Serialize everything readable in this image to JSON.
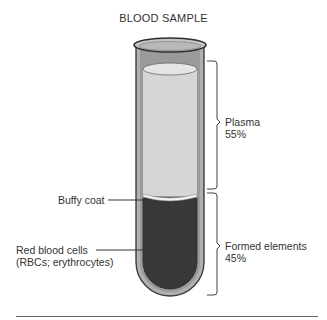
{
  "title": "BLOOD SAMPLE",
  "labels": {
    "plasma": {
      "name": "Plasma",
      "percent": "55%"
    },
    "formed": {
      "name": "Formed elements",
      "percent": "45%"
    },
    "buffy_coat": "Buffy coat",
    "rbc_line1": "Red blood cells",
    "rbc_line2": "(RBCs; erythrocytes)"
  },
  "colors": {
    "plasma": "#d4d4d4",
    "red_cells": "#3a3a3a",
    "buffy_coat": "#f2f2f2",
    "glass": "#a8a8a8",
    "outline": "#3c3c3c"
  },
  "composition": [
    {
      "component": "Plasma",
      "percent": 55
    },
    {
      "component": "Formed elements",
      "percent": 45
    }
  ]
}
